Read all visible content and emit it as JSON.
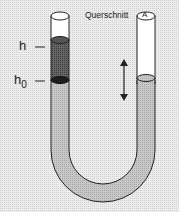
{
  "diagram": {
    "labels": {
      "h": "h",
      "h0_main": "h",
      "h0_sub": "0",
      "cross_section": "Querschnitt",
      "area": "A"
    },
    "colors": {
      "background": "#e6e6e6",
      "liquid": "#bdbdbd",
      "dark_liquid": "#555555",
      "darkest": "#222222",
      "outline": "#222222",
      "tube_inner": "#ffffff"
    }
  }
}
